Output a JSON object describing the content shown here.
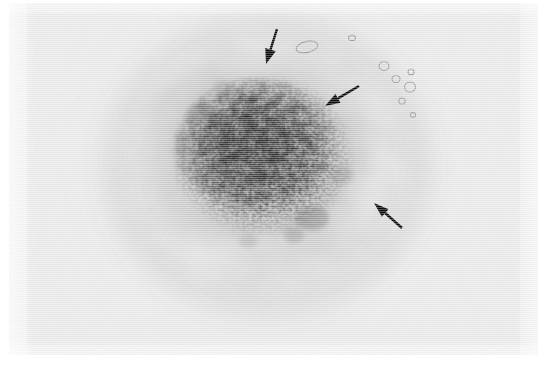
{
  "figure": {
    "kind": "grayscale-micrograph",
    "caption": "",
    "background_color": "#ededed",
    "page_color": "#ffffff",
    "annotation_color": "#0a0a0a",
    "width": 548,
    "height": 367,
    "frame": {
      "left": 9,
      "top": 3,
      "width": 529,
      "height": 352
    }
  },
  "lesion": {
    "label": "central dense granular mass",
    "center_x": 262,
    "center_y": 155,
    "core_radius_x": 90,
    "core_radius_y": 78,
    "halo_radius_x": 175,
    "halo_radius_y": 160,
    "darkest_gray": "#2b2b2b",
    "core_gray": "#5a5a5a",
    "halo_gray": "#cfcfcf"
  },
  "arrows": [
    {
      "name": "arrow-top",
      "label": "arrow 1",
      "tail_x": 277,
      "tail_y": 29,
      "tip_x": 266,
      "tip_y": 64,
      "direction": "down-left",
      "shaft_width": 2.4,
      "head_length": 15,
      "head_width": 11
    },
    {
      "name": "arrow-right-upper",
      "label": "arrow 2",
      "tail_x": 359,
      "tail_y": 86,
      "tip_x": 325,
      "tip_y": 106,
      "direction": "down-left",
      "shaft_width": 2.4,
      "head_length": 15,
      "head_width": 10
    },
    {
      "name": "arrow-right-lower",
      "label": "arrow 3",
      "tail_x": 402,
      "tail_y": 228,
      "tip_x": 374,
      "tip_y": 203,
      "direction": "up-left",
      "shaft_width": 2.4,
      "head_length": 15,
      "head_width": 10
    }
  ],
  "bubbles": [
    {
      "name": "bubble-1",
      "cx": 307,
      "cy": 47,
      "rx": 11,
      "ry": 5.5,
      "rotate": -12
    },
    {
      "name": "bubble-2",
      "cx": 384,
      "cy": 66,
      "rx": 5,
      "ry": 4.5,
      "rotate": 0
    },
    {
      "name": "bubble-3",
      "cx": 396,
      "cy": 79,
      "rx": 4,
      "ry": 3.5,
      "rotate": 0
    },
    {
      "name": "bubble-4",
      "cx": 411,
      "cy": 72,
      "rx": 3,
      "ry": 2.8,
      "rotate": 0
    },
    {
      "name": "bubble-5",
      "cx": 410,
      "cy": 87,
      "rx": 5.5,
      "ry": 5,
      "rotate": 0
    },
    {
      "name": "bubble-6",
      "cx": 402,
      "cy": 101,
      "rx": 3.2,
      "ry": 3,
      "rotate": 0
    },
    {
      "name": "bubble-7",
      "cx": 352,
      "cy": 38,
      "rx": 3.5,
      "ry": 2.6,
      "rotate": 0
    }
  ],
  "texture": {
    "grain_frequency": 0.62,
    "grain_octaves": 4,
    "speckle_frequency": 0.3,
    "speckle_octaves": 3,
    "halo_frequency": 0.016,
    "halo_octaves": 3
  }
}
